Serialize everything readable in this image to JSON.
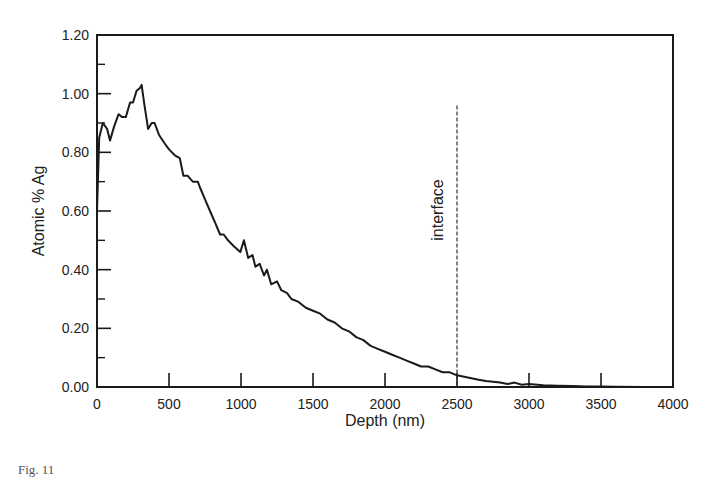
{
  "chart_data": {
    "type": "line",
    "title": "",
    "xlabel": "Depth (nm)",
    "ylabel": "Atomic % Ag",
    "xlim": [
      0,
      4000
    ],
    "ylim": [
      0,
      1.2
    ],
    "x_ticks": [
      "0",
      "500",
      "1000",
      "1500",
      "2000",
      "2500",
      "3000",
      "3500",
      "4000"
    ],
    "y_ticks": [
      "0.00",
      "0.20",
      "0.40",
      "0.60",
      "0.80",
      "1.00",
      "1.20"
    ],
    "grid": false,
    "legend": null,
    "annotations": [
      {
        "text": "interface",
        "x": 2500,
        "type": "dashed-vertical-line",
        "y_top": 0.96
      }
    ],
    "series": [
      {
        "name": "Ag profile",
        "x": [
          0,
          15,
          40,
          70,
          90,
          120,
          150,
          175,
          200,
          230,
          250,
          275,
          300,
          310,
          330,
          355,
          380,
          400,
          430,
          470,
          500,
          540,
          575,
          600,
          630,
          665,
          700,
          715,
          750,
          785,
          820,
          855,
          880,
          910,
          950,
          995,
          1020,
          1050,
          1080,
          1100,
          1130,
          1160,
          1180,
          1210,
          1250,
          1280,
          1320,
          1350,
          1400,
          1450,
          1500,
          1550,
          1600,
          1650,
          1700,
          1750,
          1800,
          1850,
          1900,
          1950,
          2000,
          2050,
          2100,
          2150,
          2200,
          2250,
          2300,
          2350,
          2400,
          2450,
          2500,
          2550,
          2600,
          2650,
          2700,
          2750,
          2800,
          2850,
          2900,
          2950,
          3000,
          3100,
          3200,
          3300,
          3400,
          3500,
          3600,
          3800,
          4000
        ],
        "values": [
          0.6,
          0.85,
          0.9,
          0.88,
          0.84,
          0.89,
          0.93,
          0.92,
          0.92,
          0.97,
          0.97,
          1.01,
          1.02,
          1.03,
          0.96,
          0.88,
          0.9,
          0.9,
          0.86,
          0.83,
          0.81,
          0.79,
          0.78,
          0.72,
          0.72,
          0.7,
          0.7,
          0.68,
          0.64,
          0.6,
          0.56,
          0.52,
          0.52,
          0.5,
          0.48,
          0.46,
          0.5,
          0.44,
          0.45,
          0.41,
          0.42,
          0.38,
          0.4,
          0.35,
          0.36,
          0.33,
          0.32,
          0.3,
          0.29,
          0.27,
          0.26,
          0.25,
          0.23,
          0.22,
          0.2,
          0.19,
          0.17,
          0.16,
          0.14,
          0.13,
          0.12,
          0.11,
          0.1,
          0.09,
          0.08,
          0.07,
          0.07,
          0.06,
          0.05,
          0.05,
          0.04,
          0.035,
          0.03,
          0.025,
          0.02,
          0.018,
          0.015,
          0.01,
          0.015,
          0.008,
          0.01,
          0.006,
          0.004,
          0.003,
          0.002,
          0.002,
          0.001,
          0.0,
          0.0
        ]
      }
    ]
  },
  "caption": "Fig. 11"
}
